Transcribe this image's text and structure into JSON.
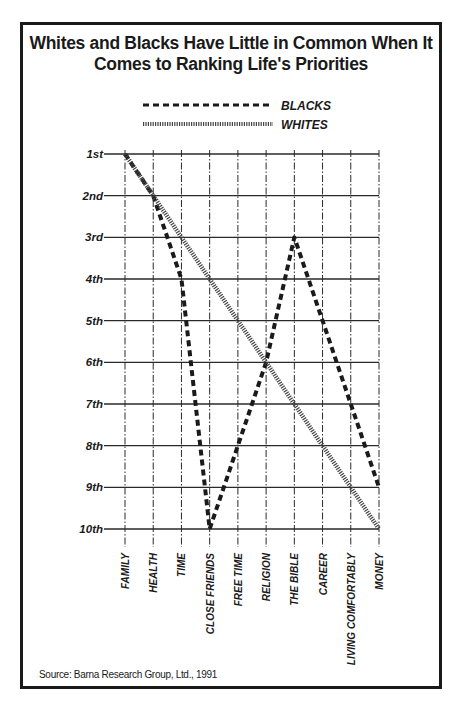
{
  "page": {
    "running_header": "338   WHAT AMERICANS BELIEVE"
  },
  "chart_data": {
    "type": "line",
    "title": "Whites and Blacks Have Little in Common When It Comes to Ranking Life's Priorities",
    "title_lines": [
      "Whites and Blacks Have Little in Common When It",
      "Comes to Ranking Life's Priorities"
    ],
    "xlabel": "",
    "ylabel": "",
    "categories": [
      "FAMILY",
      "HEALTH",
      "TIME",
      "CLOSE FRIENDS",
      "FREE TIME",
      "RELIGION",
      "THE BIBLE",
      "CAREER",
      "LIVING COMFORTABLY",
      "MONEY"
    ],
    "y_ticks": [
      "1st",
      "2nd",
      "3rd",
      "4th",
      "5th",
      "6th",
      "7th",
      "8th",
      "9th",
      "10th"
    ],
    "ylim": [
      1,
      10
    ],
    "y_inverted": true,
    "series": [
      {
        "name": "BLACKS",
        "style": "dashed",
        "values": [
          1,
          2,
          4,
          10,
          8,
          6,
          3,
          5,
          7,
          9
        ]
      },
      {
        "name": "WHITES",
        "style": "dotted",
        "values": [
          1,
          2,
          3,
          4,
          5,
          6,
          7,
          8,
          9,
          10
        ]
      }
    ],
    "legend_position": "top-center",
    "grid": true,
    "source": "Source: Barna Research Group, Ltd., 1991"
  },
  "colors": {
    "ink": "#1a1a1a",
    "grid": "#2a2a2a",
    "background": "#ffffff"
  }
}
